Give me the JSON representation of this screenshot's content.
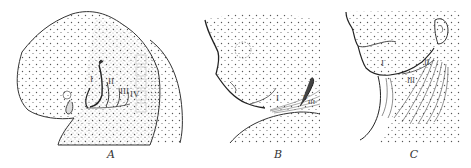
{
  "figure": {
    "ink_color": "#333333",
    "background": "#ffffff",
    "panels": [
      {
        "id": "A",
        "caption": "A",
        "arch_labels": [
          "I",
          "II",
          "III",
          "IV"
        ]
      },
      {
        "id": "B",
        "caption": "B",
        "arch_labels": [
          "I",
          "II",
          "III"
        ]
      },
      {
        "id": "C",
        "caption": "C",
        "arch_labels": [
          "I",
          "II",
          "III"
        ]
      }
    ]
  }
}
